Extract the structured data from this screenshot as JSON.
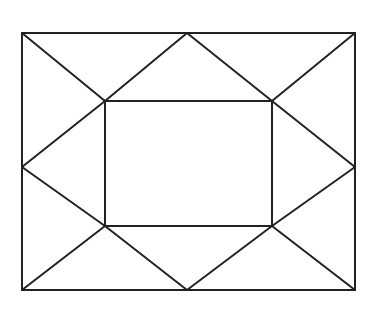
{
  "diagram": {
    "type": "geometric-line-drawing",
    "stroke_color": "#222222",
    "background_color": "#ffffff",
    "outer_rect": {
      "x1": 22,
      "y1": 33,
      "x2": 355,
      "y2": 290
    },
    "inner_rect": {
      "x1": 105,
      "y1": 101,
      "x2": 272,
      "y2": 226
    },
    "midpoints": {
      "top": [
        187,
        33
      ],
      "bottom": [
        187,
        290
      ],
      "left": [
        22,
        167
      ],
      "right": [
        355,
        167
      ]
    }
  }
}
